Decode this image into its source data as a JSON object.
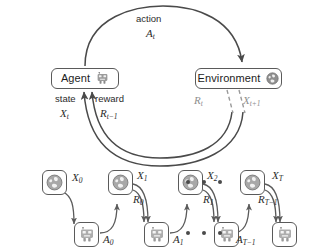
{
  "diagram": {
    "colors": {
      "stroke": "#4a4a4a",
      "dashed_stroke": "#9a9a9a",
      "box_border": "#5a5a5a",
      "text": "#1c1c1c",
      "icon_gray": "#8a8a8a"
    },
    "loop": {
      "agent": {
        "label": "Agent",
        "icon": "robot-icon"
      },
      "environment": {
        "label": "Environment",
        "icon": "globe-icon"
      },
      "action_label_text": "action",
      "action_label_math": "A",
      "action_label_sub": "t",
      "state_label_text": "state",
      "state_label_math": "X",
      "state_label_sub": "t",
      "reward_label_text": "reward",
      "reward_label_math": "R",
      "reward_label_sub": "t−1",
      "env_reward_math": "R",
      "env_reward_sub": "t",
      "env_state_math": "X",
      "env_state_sub": "t+1"
    },
    "timeline": {
      "ellipsis_dot_count": 3,
      "steps": [
        {
          "index": 0,
          "env_icon": "globe-icon",
          "agent_icon": "robot-icon",
          "state_math": "X",
          "state_sub": "0",
          "action_math": "A",
          "action_sub": "0",
          "reward_math": "",
          "reward_sub": ""
        },
        {
          "index": 1,
          "env_icon": "globe-icon",
          "agent_icon": "robot-icon",
          "state_math": "X",
          "state_sub": "1",
          "action_math": "A",
          "action_sub": "1",
          "reward_math": "R",
          "reward_sub": "0"
        },
        {
          "index": 2,
          "env_icon": "globe-icon",
          "agent_icon": "robot-icon",
          "state_math": "X",
          "state_sub": "2",
          "action_math": "",
          "action_sub": "",
          "reward_math": "R",
          "reward_sub": "1"
        },
        {
          "index": 3,
          "env_icon": "globe-icon",
          "agent_icon": "robot-icon",
          "state_math": "X",
          "state_sub": "T",
          "action_math": "A",
          "action_sub": "T−1",
          "reward_math": "R",
          "reward_sub": "T−1"
        }
      ]
    }
  }
}
